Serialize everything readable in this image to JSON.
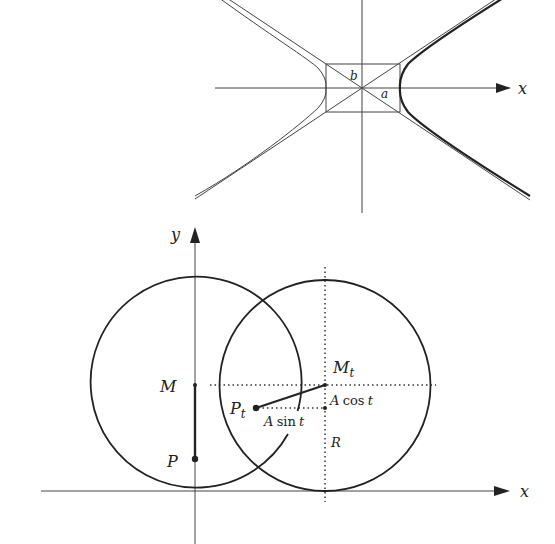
{
  "colors": {
    "ink": "#222222",
    "thin_line": "#444444",
    "background": "#ffffff"
  },
  "top_figure": {
    "title": "hyperbola with asymptote rectangle",
    "x_axis_label": "x",
    "semi_axis_a_label": "a",
    "semi_axis_b_label": "b"
  },
  "bottom_figure": {
    "title": "two rolling circles",
    "x_axis_label": "x",
    "y_axis_label": "y",
    "point_M_label": "M",
    "point_P_label": "P",
    "point_Mt_label": "M",
    "point_Mt_sub": "t",
    "point_Pt_label": "P",
    "point_Pt_sub": "t",
    "a_cos_label_A": "A",
    "a_cos_label_fn": "cos",
    "a_cos_label_t": "t",
    "a_sin_label_A": "A",
    "a_sin_label_fn": "sin",
    "a_sin_label_t": "t",
    "radius_label": "R"
  }
}
